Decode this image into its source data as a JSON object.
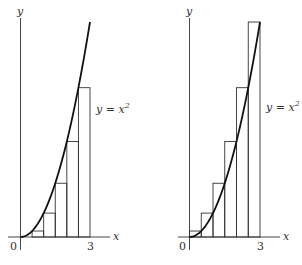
{
  "figure": {
    "panels": [
      {
        "id": "left",
        "method": "lower sums (left endpoints)",
        "y_axis_label": "y",
        "x_axis_label": "x",
        "origin_label": "0",
        "x_tick_label": "3",
        "curve_label": "y = x",
        "curve_label_exp": "2",
        "rect_heights": [
          0,
          0.25,
          1,
          2.25,
          4,
          6.25
        ]
      },
      {
        "id": "right",
        "method": "upper sums (right endpoints)",
        "y_axis_label": "y",
        "x_axis_label": "x",
        "origin_label": "0",
        "x_tick_label": "3",
        "curve_label": "y = x",
        "curve_label_exp": "2",
        "rect_heights": [
          0.25,
          1,
          2.25,
          4,
          6.25,
          9
        ]
      }
    ],
    "function": "y = x^2",
    "interval": [
      0,
      3
    ],
    "subintervals": 6,
    "width": 0.5
  }
}
